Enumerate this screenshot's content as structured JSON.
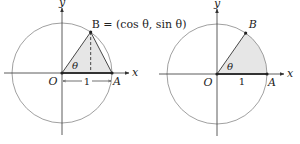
{
  "figures": [
    {
      "id": "left",
      "description": "Unit circle with triangle OAB shaded and dashed vertical from B",
      "angle_deg": 55,
      "labels": {
        "x_axis": "x",
        "y_axis": "y",
        "origin": "O",
        "point_a": "A",
        "point_b": "B = (cos θ, sin θ)",
        "angle": "θ",
        "radius": "1"
      },
      "shaded_region": "triangle",
      "has_dashed_height": true,
      "has_radius_dimension": true
    },
    {
      "id": "right",
      "description": "Unit circle with circular sector OAB shaded",
      "angle_deg": 55,
      "labels": {
        "x_axis": "x",
        "y_axis": "y",
        "origin": "O",
        "point_a": "A",
        "point_b": "B",
        "angle": "θ",
        "radius": "1"
      },
      "shaded_region": "sector",
      "has_dashed_height": false,
      "has_radius_dimension": false
    }
  ],
  "colors": {
    "stroke": "#333333",
    "circle": "#888888",
    "shade": "#e6e6e6"
  }
}
